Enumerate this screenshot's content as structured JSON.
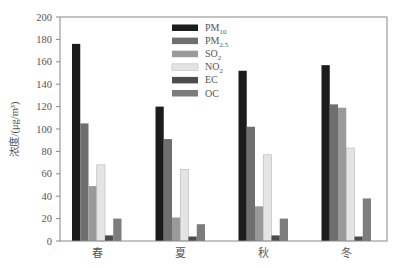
{
  "chart_data": {
    "type": "bar",
    "title": "",
    "xlabel": "",
    "ylabel": "浓度/(μg/m³)",
    "ylim": [
      0,
      200
    ],
    "yticks": [
      0,
      20,
      40,
      60,
      80,
      100,
      120,
      140,
      160,
      180,
      200
    ],
    "grid": false,
    "legend_position": "upper center",
    "categories": [
      "春",
      "夏",
      "秋",
      "冬"
    ],
    "series": [
      {
        "name": "PM10",
        "label_main": "PM",
        "label_sub": "10",
        "color": "#1c1c1c",
        "values": [
          176,
          120,
          152,
          157
        ]
      },
      {
        "name": "PM2.5",
        "label_main": "PM",
        "label_sub": "2.5",
        "color": "#6f6f6f",
        "values": [
          105,
          91,
          102,
          122
        ]
      },
      {
        "name": "SO2",
        "label_main": "SO",
        "label_sub": "2",
        "color": "#9a9a9a",
        "values": [
          49,
          21,
          31,
          119
        ]
      },
      {
        "name": "NO2",
        "label_main": "NO",
        "label_sub": "2",
        "color": "#e4e4e4",
        "values": [
          68,
          64,
          77,
          83
        ]
      },
      {
        "name": "EC",
        "label_main": "EC",
        "label_sub": "",
        "color": "#4c4c4c",
        "values": [
          5,
          4,
          5,
          4
        ]
      },
      {
        "name": "OC",
        "label_main": "OC",
        "label_sub": "",
        "color": "#7d7d7d",
        "values": [
          20,
          15,
          20,
          38
        ]
      }
    ]
  }
}
